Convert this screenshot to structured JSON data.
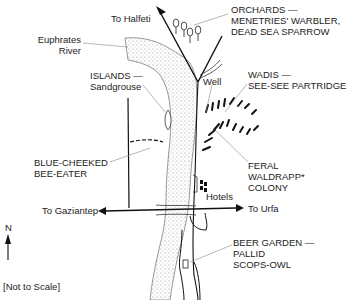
{
  "map": {
    "labels": {
      "to_halfeti": "To Halfeti",
      "river_line1": "Euphrates",
      "river_line2": "River",
      "orchards_line1": "ORCHARDS —",
      "orchards_line2": "MENETRIES' WARBLER,",
      "orchards_line3": "DEAD SEA SPARROW",
      "islands_line1": "ISLANDS —",
      "islands_line2": "Sandgrouse",
      "well": "Well",
      "wadis_line1": "WADIS —",
      "wadis_line2": "SEE-SEE PARTRIDGE",
      "bee_eater_line1": "BLUE-CHEEKED",
      "bee_eater_line2": "BEE-EATER",
      "waldrapp_line1": "FERAL",
      "waldrapp_line2": "WALDRAPP*",
      "waldrapp_line3": "COLONY",
      "hotels": "Hotels",
      "to_gaziantep": "To Gaziantep",
      "to_urfa": "To Urfa",
      "north": "N",
      "beer_garden_line1": "BEER GARDEN —",
      "beer_garden_line2": "PALLID",
      "beer_garden_line3": "SCOPS-OWL",
      "scale_note": "[Not to Scale]"
    },
    "colors": {
      "ink": "#1a1a1a",
      "leader": "#777777",
      "river_stipple": "#9a9a9a"
    }
  }
}
